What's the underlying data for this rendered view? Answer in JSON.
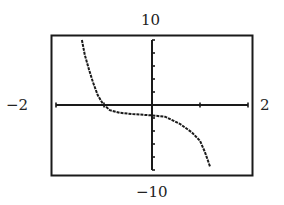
{
  "chart_data": {
    "type": "line",
    "title": "",
    "xlabel": "",
    "ylabel": "",
    "xlim": [
      -2,
      2
    ],
    "ylim": [
      -10,
      10
    ],
    "x_scale_tick": 1,
    "y_scale_tick": 2,
    "grid": false,
    "window_labels": {
      "xmin": "−2",
      "xmax": "2",
      "ymin": "−10",
      "ymax": "10"
    },
    "series": [
      {
        "name": "f(x)",
        "x": [
          -1.46,
          -1.4,
          -1.31,
          -1.23,
          -1.13,
          -1.02,
          -0.88,
          -0.67,
          -0.4,
          0.0,
          0.27,
          0.58,
          0.83,
          1.0,
          1.1,
          1.21
        ],
        "y": [
          10.0,
          7.7,
          5.4,
          3.5,
          1.5,
          0.15,
          -0.8,
          -1.2,
          -1.4,
          -1.6,
          -1.8,
          -2.9,
          -4.2,
          -5.5,
          -7.2,
          -9.5
        ]
      }
    ],
    "colors": {
      "axis": "#1a1a1a",
      "curve": "#1a1a1a",
      "frame": "#1a1a1a"
    }
  }
}
